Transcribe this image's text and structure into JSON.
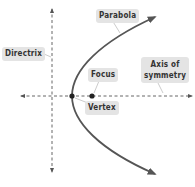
{
  "diagram": {
    "type": "parabola-anatomy",
    "labels": {
      "parabola": "Parabola",
      "directrix": "Directrix",
      "axis_line1": "Axis of",
      "axis_line2": "symmetry",
      "focus": "Focus",
      "vertex": "Vertex"
    },
    "points": {
      "vertex": {
        "x": 72,
        "y": 96
      },
      "focus": {
        "x": 92,
        "y": 96
      }
    },
    "colors": {
      "curve": "#555555",
      "dashed_lines": "#555555",
      "label_bg": "#e4e4e4",
      "label_text": "#333333",
      "point": "#222222"
    }
  }
}
